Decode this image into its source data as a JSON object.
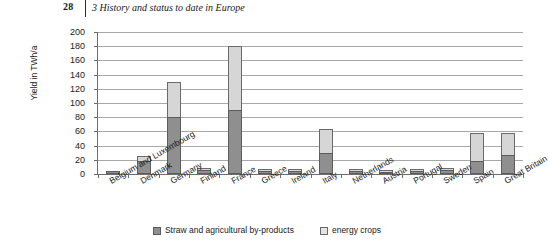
{
  "header": {
    "page_number": "28",
    "title": "3  History and status to date in Europe"
  },
  "chart_data": {
    "type": "bar",
    "stacked": true,
    "title": "",
    "xlabel": "",
    "ylabel": "Yield in TWh/a",
    "ylim": [
      0,
      200
    ],
    "yticks": [
      0,
      20,
      40,
      60,
      80,
      100,
      120,
      140,
      160,
      180,
      200
    ],
    "grid": true,
    "legend_position": "bottom",
    "categories": [
      "Belgium and Luxembourg",
      "Denmark",
      "Germany",
      "Finland",
      "France",
      "Greece",
      "Ireland",
      "Italy",
      "Netherlands",
      "Austria",
      "Portugal",
      "Sweden",
      "Spain",
      "Great Britain"
    ],
    "series": [
      {
        "name": "Straw and agricultural by-products",
        "color": "#8f8f8f",
        "values": [
          4,
          18,
          80,
          6,
          90,
          4,
          4,
          30,
          4,
          3,
          4,
          6,
          18,
          27
        ]
      },
      {
        "name": "energy crops",
        "color": "#d6d6d6",
        "values": [
          0,
          7,
          50,
          2,
          90,
          2,
          2,
          33,
          2,
          1,
          2,
          3,
          40,
          31
        ]
      }
    ],
    "totals": [
      4,
      25,
      130,
      8,
      180,
      6,
      6,
      63,
      6,
      4,
      6,
      9,
      58,
      58
    ]
  },
  "legend": {
    "items": [
      {
        "label": "Straw and agricultural by-products",
        "swatch": "dark"
      },
      {
        "label": "energy crops",
        "swatch": "light"
      }
    ]
  }
}
